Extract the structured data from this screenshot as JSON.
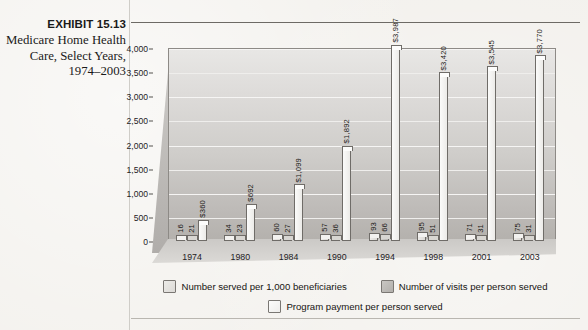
{
  "exhibit": {
    "label": "EXHIBIT 15.13",
    "caption": "Medicare Home Health Care, Select Years, 1974–2003"
  },
  "legend": {
    "items": [
      {
        "label": "Number served per 1,000 beneficiaries",
        "swatch": "sw1"
      },
      {
        "label": "Number of visits per person served",
        "swatch": "sw2"
      },
      {
        "label": "Program payment per person served",
        "swatch": "sw3"
      }
    ]
  },
  "chart_data": {
    "type": "bar",
    "title": "Medicare Home Health Care, Select Years, 1974–2003",
    "xlabel": "",
    "ylabel": "",
    "ylim": [
      0,
      4000
    ],
    "yticks": [
      0,
      500,
      1000,
      1500,
      2000,
      2500,
      3000,
      3500,
      4000
    ],
    "ytick_labels": [
      "0",
      "500",
      "1,000",
      "1,500",
      "2,000",
      "2,500",
      "3,000",
      "3,500",
      "4,000"
    ],
    "grid": true,
    "legend_position": "bottom",
    "categories": [
      "1974",
      "1980",
      "1984",
      "1990",
      "1994",
      "1998",
      "2001",
      "2003"
    ],
    "series": [
      {
        "name": "Number served per 1,000 beneficiaries",
        "values": [
          16,
          34,
          60,
          57,
          93,
          95,
          71,
          75
        ],
        "labels": [
          "16",
          "34",
          "60",
          "57",
          "93",
          "95",
          "71",
          "75"
        ]
      },
      {
        "name": "Number of visits per person served",
        "values": [
          21,
          23,
          27,
          36,
          66,
          51,
          31,
          31
        ],
        "labels": [
          "21",
          "23",
          "27",
          "36",
          "66",
          "51",
          "31",
          "31"
        ]
      },
      {
        "name": "Program payment per person served",
        "values": [
          360,
          692,
          1099,
          1892,
          3987,
          3420,
          3545,
          3770
        ],
        "labels": [
          "$360",
          "$692",
          "$1,099",
          "$1,892",
          "$3,987",
          "$3,420",
          "$3,545",
          "$3,770"
        ]
      }
    ]
  },
  "colors": {
    "series1": "#e4e2df",
    "series2": "#c2bfbb",
    "series3": "#f6f5f3",
    "wall": "#cfcdca",
    "outline": "#6f6c68",
    "text": "#1a1a1a"
  }
}
